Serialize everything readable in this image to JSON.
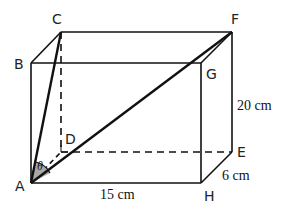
{
  "diagram": {
    "type": "cuboid",
    "vertices": {
      "A": {
        "label": "A"
      },
      "B": {
        "label": "B"
      },
      "C": {
        "label": "C"
      },
      "D": {
        "label": "D"
      },
      "E": {
        "label": "E"
      },
      "F": {
        "label": "F"
      },
      "G": {
        "label": "G"
      },
      "H": {
        "label": "H"
      }
    },
    "measurements": {
      "length": "15 cm",
      "width": "6 cm",
      "height": "20 cm"
    },
    "angle": {
      "symbol": "θ",
      "between": [
        "AC",
        "AF"
      ]
    },
    "colors": {
      "line": "#111111",
      "angle_fill": "#a8a8a8"
    }
  }
}
